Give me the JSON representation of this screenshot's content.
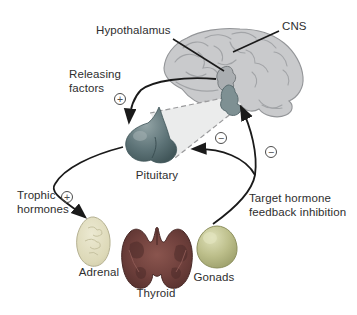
{
  "figure": {
    "labels": {
      "hypothalamus": "Hypothalamus",
      "cns": "CNS",
      "releasing_factors": "Releasing\nfactors",
      "trophic_hormones": "Trophic\nhormones",
      "target_feedback": "Target hormone\nfeedback inhibition",
      "pituitary": "Pituitary",
      "adrenal": "Adrenal",
      "thyroid": "Thyroid",
      "gonads": "Gonads"
    },
    "symbols": {
      "plus": "+",
      "minus": "−"
    },
    "colors": {
      "brain": "#c9cacc",
      "brain_outline": "#939598",
      "pituitary": "#5e7478",
      "adrenal": "#ddd9b8",
      "thyroid": "#6f403c",
      "gonads": "#bcbe8a",
      "arrow": "#1a1a1a",
      "text": "#2e2e2e",
      "sign": "#4d4d4d"
    }
  }
}
